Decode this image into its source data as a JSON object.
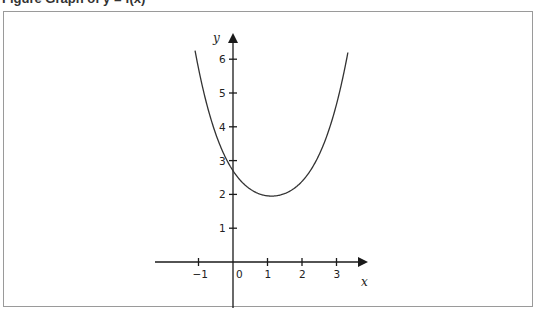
{
  "figure": {
    "caption": "Figure  Graph of y = f(x)",
    "colors": {
      "axis": "#1a1a1a",
      "curve": "#333333",
      "frame": "#9a9a9a",
      "background": "#ffffff"
    }
  },
  "chart_data": {
    "type": "line",
    "title": "",
    "xlabel": "x",
    "ylabel": "y",
    "x_ticks": [
      "−1",
      "0",
      "1",
      "2",
      "3"
    ],
    "x_tick_values": [
      -1,
      0,
      1,
      2,
      3
    ],
    "y_ticks": [
      "1",
      "2",
      "3",
      "4",
      "5",
      "6"
    ],
    "y_tick_values": [
      1,
      2,
      3,
      4,
      5,
      6
    ],
    "xlim": [
      -2.2,
      3.9
    ],
    "ylim": [
      0,
      6.7
    ],
    "grid": false,
    "legend": null,
    "annotations": [
      "curve crosses y-axis at about y = 2.7",
      "minimum at about (1.1, 1.95)"
    ],
    "series": [
      {
        "name": "curve",
        "x": [
          -1.1,
          -0.9,
          -0.7,
          -0.5,
          -0.3,
          -0.1,
          0.0,
          0.1,
          0.3,
          0.5,
          0.7,
          0.9,
          1.1,
          1.3,
          1.5,
          1.7,
          1.9,
          2.1,
          2.3,
          2.5,
          2.7,
          2.9,
          3.1,
          3.33
        ],
        "y": [
          6.2,
          5.45,
          4.72,
          4.09,
          3.56,
          3.12,
          2.7,
          2.63,
          2.38,
          2.17,
          2.04,
          1.97,
          1.95,
          1.97,
          2.03,
          2.15,
          2.33,
          2.59,
          2.95,
          3.43,
          4.07,
          4.85,
          5.82,
          6.2
        ]
      }
    ]
  },
  "labels": {
    "x_axis": "x",
    "y_axis": "y",
    "x_ticks": [
      "−1",
      "0",
      "1",
      "2",
      "3"
    ],
    "y_ticks": [
      "1",
      "2",
      "3",
      "4",
      "5",
      "6"
    ]
  }
}
